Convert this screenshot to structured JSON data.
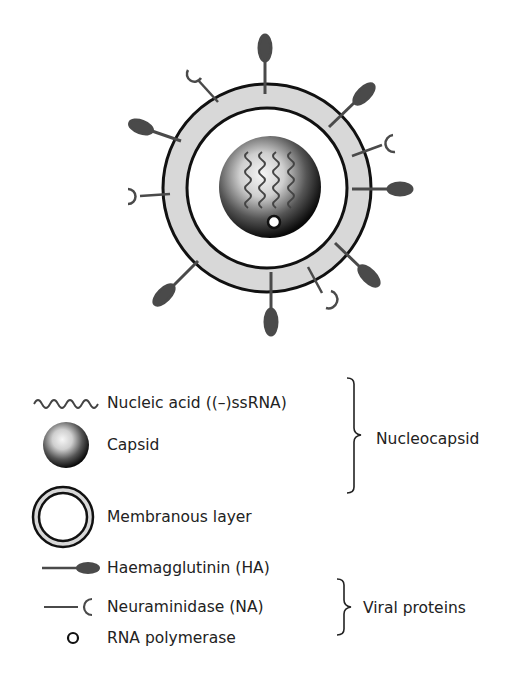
{
  "diagram": {
    "type": "influenza virus structure",
    "colors": {
      "ring_fill": "#d8d8d8",
      "outline": "#111111",
      "spike": "#4a4a4a",
      "text": "#222222"
    }
  },
  "legend": {
    "items": [
      {
        "icon": "wavy-line-icon",
        "label": "Nucleic acid ((–)ssRNA)"
      },
      {
        "icon": "sphere-icon",
        "label": "Capsid"
      },
      {
        "icon": "double-ring-icon",
        "label": "Membranous layer"
      },
      {
        "icon": "haemagglutinin-spike-icon",
        "label": "Haemagglutinin (HA)"
      },
      {
        "icon": "neuraminidase-spike-icon",
        "label": "Neuraminidase (NA)"
      },
      {
        "icon": "small-circle-icon",
        "label": "RNA polymerase"
      }
    ],
    "groups": [
      {
        "label": "Nucleocapsid",
        "covers": [
          "Nucleic acid ((–)ssRNA)",
          "Capsid",
          "Membranous layer"
        ]
      },
      {
        "label": "Viral proteins",
        "covers": [
          "Haemagglutinin (HA)",
          "Neuraminidase (NA)",
          "RNA polymerase"
        ]
      }
    ]
  }
}
